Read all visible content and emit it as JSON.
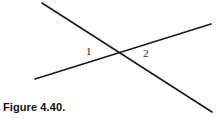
{
  "figure": {
    "caption": "Figure 4.40.",
    "background_color": "#ffffff",
    "stroke_color": "#1a1a1a",
    "labels": [
      {
        "text": "1",
        "x": 89,
        "y": 52
      },
      {
        "text": "2",
        "x": 146,
        "y": 54
      }
    ]
  },
  "chart_data": {
    "type": "diagram",
    "title": "Figure 4.40.",
    "width": 216,
    "height": 118,
    "lines": [
      {
        "name": "descending-line",
        "x1": 42,
        "y1": 3,
        "x2": 212,
        "y2": 112,
        "stroke": "#1a1a1a",
        "stroke_width": 1.6
      },
      {
        "name": "ascending-line",
        "x1": 35,
        "y1": 79,
        "x2": 211,
        "y2": 24,
        "stroke": "#1a1a1a",
        "stroke_width": 1.6
      }
    ],
    "intersection": {
      "x": 122,
      "y": 53
    },
    "annotations": [
      {
        "label": "1",
        "x": 89,
        "y": 52,
        "meaning": "angle left of intersection"
      },
      {
        "label": "2",
        "x": 146,
        "y": 54,
        "meaning": "angle right of intersection"
      }
    ],
    "grid": false,
    "legend": null,
    "xlabel": "",
    "ylabel": ""
  }
}
